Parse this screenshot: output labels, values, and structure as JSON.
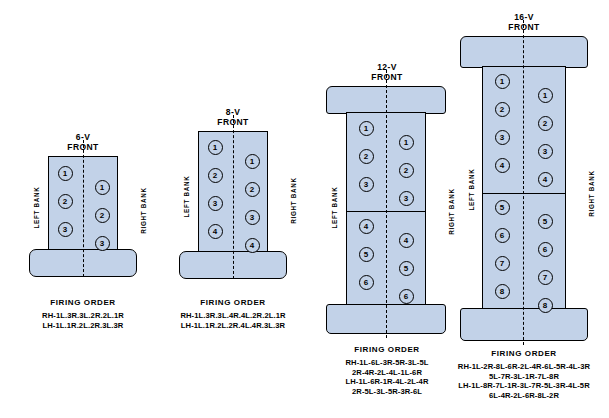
{
  "diagram": {
    "bank_labels": {
      "left": "LEFT BANK",
      "right": "RIGHT BANK"
    },
    "front_label": "FRONT",
    "firing_order_title": "FIRING ORDER"
  },
  "engines": [
    {
      "id": "6v",
      "name": "6-V",
      "heading": "6-V\nFRONT",
      "cylinders_per_bank": 3,
      "left_numbers": [
        "1",
        "2",
        "3"
      ],
      "right_numbers": [
        "1",
        "2",
        "3"
      ],
      "firing_order": {
        "title": "FIRING ORDER",
        "lines": [
          "RH-1L.3R.3L.2R.2L.1R",
          "LH-1L.1R.2L.2R.3L.3R"
        ]
      }
    },
    {
      "id": "8v",
      "name": "8-V",
      "heading": "8-V\nFRONT",
      "cylinders_per_bank": 4,
      "left_numbers": [
        "1",
        "2",
        "3",
        "4"
      ],
      "right_numbers": [
        "1",
        "2",
        "3",
        "4"
      ],
      "firing_order": {
        "title": "FIRING ORDER",
        "lines": [
          "RH-1L.3R.3L.4R.4L.2R.2L.1R",
          "LH-1L.1R.2L.2R.4L.4R.3L.3R"
        ]
      }
    },
    {
      "id": "12v",
      "name": "12-V",
      "heading": "12-V\nFRONT",
      "cylinders_per_bank": 6,
      "left_numbers": [
        "1",
        "2",
        "3",
        "4",
        "5",
        "6"
      ],
      "right_numbers": [
        "1",
        "2",
        "3",
        "4",
        "5",
        "6"
      ],
      "firing_order": {
        "title": "FIRING ORDER",
        "lines": [
          "RH-1L-6L-3R-5R-3L-5L",
          "2R-4R-2L-4L-1L-6R",
          "LH-1L-6R-1R-4L-2L-4R",
          "2R-5L-3L-5R-3R-6L"
        ]
      }
    },
    {
      "id": "16v",
      "name": "16-V",
      "heading": "16-V\nFRONT",
      "cylinders_per_bank": 8,
      "left_numbers": [
        "1",
        "2",
        "3",
        "4",
        "5",
        "6",
        "7",
        "8"
      ],
      "right_numbers": [
        "1",
        "2",
        "3",
        "4",
        "5",
        "6",
        "7",
        "8"
      ],
      "firing_order": {
        "title": "FIRING ORDER",
        "lines": [
          "RH-1L-2R-8L-6R-2L-4R-6L-5R-4L-3R",
          "5L-7R-3L-1R-7L-8R",
          "LH-1L-8R-7L-1R-3L-7R-5L-3R-4L-5R",
          "6L-4R-2L-6R-8L-2R"
        ]
      }
    }
  ],
  "colors": {
    "block_fill": "#c2d2e8",
    "outline": "#000000",
    "background": "#ffffff"
  }
}
